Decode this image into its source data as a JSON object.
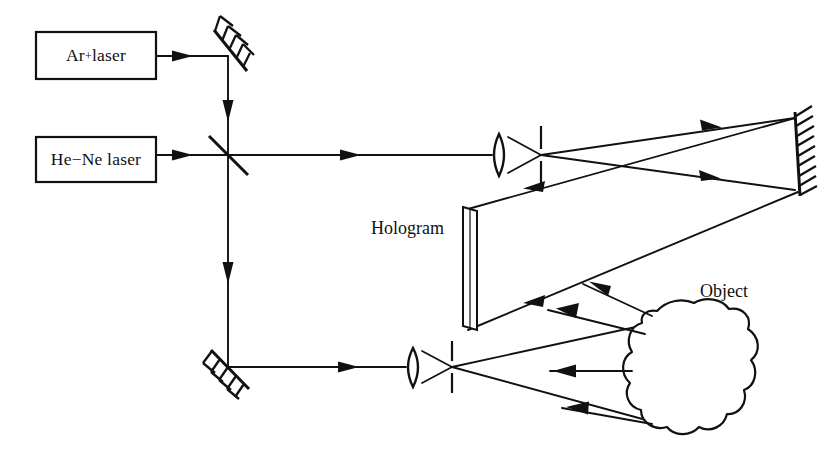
{
  "figure": {
    "background_color": "#ffffff",
    "line_color": "#111111",
    "width": 828,
    "height": 451
  },
  "sources": {
    "ar_laser": {
      "label_prefix": "Ar",
      "label_superscript": "+",
      "label_suffix": " laser",
      "full_label": "Ar+ laser"
    },
    "hene_laser": {
      "full_label": "He−Ne laser"
    }
  },
  "components": {
    "turning_mirror_label": "turning-mirror",
    "beam_splitter_label": "beam-splitter",
    "folding_mirror_label": "folding-mirror",
    "reference_lens_label": "reference-beam-lens",
    "reference_pinhole_label": "reference-pinhole",
    "object_lens_label": "object-beam-lens",
    "object_pinhole_label": "object-pinhole",
    "large_mirror_label": "large-flat-mirror",
    "hologram": {
      "label": "Hologram"
    },
    "object": {
      "label": "Object"
    }
  },
  "beams": {
    "ar_to_mirror": "Ar+ laser horizontal beam to turning mirror",
    "mirror_down_to_splitter": "vertical beam from turning mirror down to beam splitter",
    "hene_to_splitter": "He-Ne laser horizontal beam to beam splitter",
    "splitter_to_reference_lens": "reference arm horizontal beam",
    "splitter_down_to_folding_mirror": "vertical beam down to folding mirror",
    "folding_mirror_to_object_lens": "object arm horizontal beam",
    "reference_expanding": "expanded reference beam to large mirror",
    "mirror_to_hologram": "reflected reference beam onto hologram plate",
    "object_illumination": "expanded object beam illuminating object",
    "object_scatter": "scattered object light toward hologram"
  }
}
